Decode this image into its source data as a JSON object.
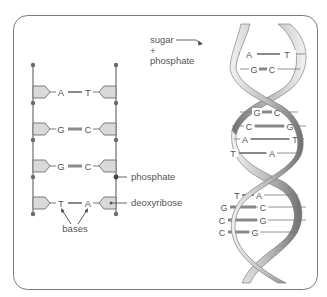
{
  "colors": {
    "frame": "#7a7a7a",
    "line": "#6e6e6e",
    "dot": "#6b6b6b",
    "sugar_fill": "#d9d9d9",
    "text": "#555555",
    "bond": "#8a8a8a",
    "ribbon_light": "#eeeeee",
    "ribbon_dark": "#7c7c7c"
  },
  "ladder": {
    "pairs": [
      {
        "left": "A",
        "right": "T",
        "bond": "double"
      },
      {
        "left": "G",
        "right": "C",
        "bond": "triple"
      },
      {
        "left": "G",
        "right": "C",
        "bond": "triple"
      },
      {
        "left": "T",
        "right": "A",
        "bond": "double"
      }
    ],
    "labels": {
      "phosphate": "phosphate",
      "deoxyribose": "deoxyribose",
      "bases": "bases"
    }
  },
  "helix": {
    "labels": {
      "sugar": "sugar",
      "plus": "+",
      "phosphate": "phosphate"
    },
    "pairs": [
      {
        "left": "A",
        "right": "T"
      },
      {
        "left": "G",
        "right": "C"
      },
      {
        "left": "G",
        "right": "C"
      },
      {
        "left": "C",
        "right": "G"
      },
      {
        "left": "A",
        "right": "T"
      },
      {
        "left": "T",
        "right": "A"
      },
      {
        "left": "T",
        "right": "A"
      },
      {
        "left": "G",
        "right": "C"
      },
      {
        "left": "C",
        "right": "G"
      },
      {
        "left": "C",
        "right": "G"
      }
    ]
  }
}
